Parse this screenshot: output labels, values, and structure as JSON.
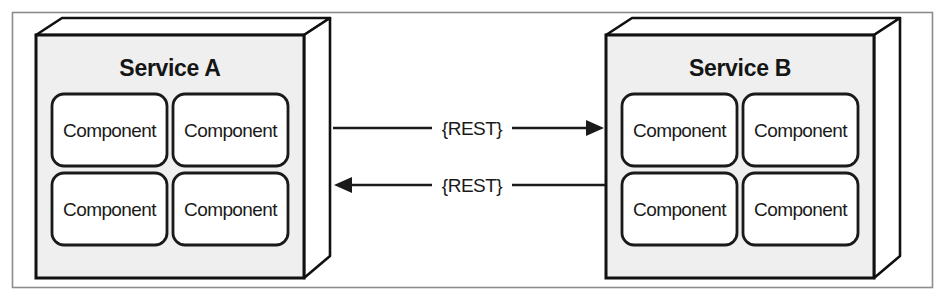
{
  "diagram": {
    "background_color": "#ffffff",
    "frame": {
      "name": "figure-frame",
      "stroke_color": "#8c8c8c",
      "fill_color": "#ffffff"
    },
    "colors": {
      "box_fill": "#efefef",
      "box_top_fill": "#ffffff",
      "box_side_fill": "#ffffff",
      "box_stroke": "#111111",
      "component_fill": "#ffffff",
      "component_stroke": "#1a1a1a",
      "arrow_color": "#1a1a1a",
      "text_color": "#151515"
    },
    "services": [
      {
        "id": "service-a",
        "title": "Service A",
        "components": [
          {
            "label": "Component"
          },
          {
            "label": "Component"
          },
          {
            "label": "Component"
          },
          {
            "label": "Component"
          }
        ]
      },
      {
        "id": "service-b",
        "title": "Service B",
        "components": [
          {
            "label": "Component"
          },
          {
            "label": "Component"
          },
          {
            "label": "Component"
          },
          {
            "label": "Component"
          }
        ]
      }
    ],
    "connections": [
      {
        "id": "a-to-b",
        "label": "{REST}",
        "from": "service-a",
        "to": "service-b",
        "direction": "right"
      },
      {
        "id": "b-to-a",
        "label": "{REST}",
        "from": "service-b",
        "to": "service-a",
        "direction": "left"
      }
    ]
  }
}
